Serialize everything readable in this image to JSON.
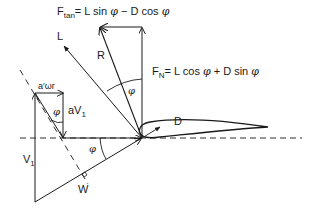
{
  "diagram": {
    "colors": {
      "stroke": "#1a1a1a",
      "text": "#1a1a1a",
      "background": "#ffffff"
    },
    "labels": {
      "f_tan": {
        "main": "F",
        "sub": "tan",
        "rest": "= L sin ",
        "phi": "φ",
        "rest2": " − D cos ",
        "phi2": "φ"
      },
      "f_n": {
        "main": "F",
        "sub": "N",
        "rest": "= L cos ",
        "phi": "φ",
        "rest2": " + D sin ",
        "phi2": "φ"
      },
      "lift": "L",
      "resultant": "R",
      "drag": "D",
      "tangential_induced": "a′ωr",
      "axial_induced_main": "aV",
      "axial_induced_sub": "1",
      "freestream_main": "V",
      "freestream_sub": "1",
      "relative_velocity": "W",
      "phi_top": "φ",
      "phi_left": "φ",
      "phi_bottom": "φ"
    }
  }
}
